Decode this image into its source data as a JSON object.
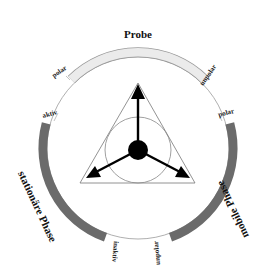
{
  "diagram": {
    "title": "Probe",
    "segments": [
      {
        "name": "Probe",
        "start_label": "polar",
        "end_label": "unpolar",
        "color": "#ebebeb",
        "stroke": "#9a9a9a"
      },
      {
        "name": "mobile Phase",
        "start_label": "polar",
        "end_label": "unpolar",
        "color": "#6b6b6b"
      },
      {
        "name": "stationäre Phase",
        "start_label": "aktiv",
        "end_label": "inaktiv",
        "color": "#6b6b6b"
      }
    ],
    "labels": {
      "probe": "Probe",
      "probe_polar": "polar",
      "probe_unpolar": "unpolar",
      "mobile_polar": "polar",
      "mobile_unpolar": "unpolar",
      "mobile_phase": "mobile Phase",
      "stationary_aktiv": "aktiv",
      "stationary_inaktiv": "inaktiv",
      "stationary_phase": "stationäre Phase"
    },
    "colors": {
      "ring": "#9a9a9a",
      "dark_arc": "#6b6b6b",
      "light_arc": "#ebebeb",
      "ink": "#000000"
    }
  }
}
